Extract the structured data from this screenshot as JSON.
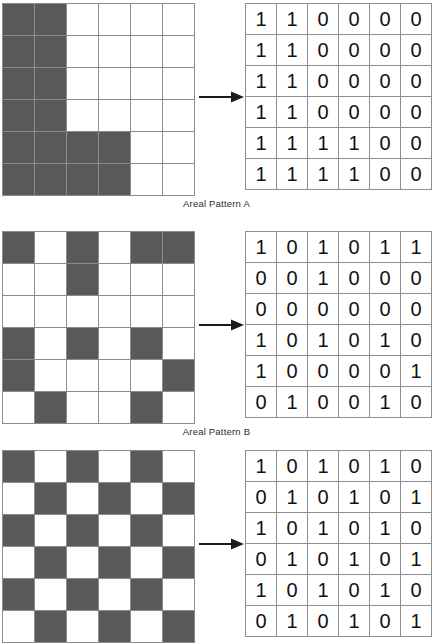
{
  "figure": {
    "colors": {
      "filled_cell": "#595959",
      "empty_cell": "#ffffff",
      "grid_line": "#8c8c8c",
      "table_border": "#8e8e8e",
      "arrow": "#1a1a1a",
      "text": "#2b2b2b"
    },
    "grid_size": {
      "rows": 6,
      "cols": 6
    }
  },
  "sections": [
    {
      "id": "a",
      "caption": "Areal Pattern A",
      "arrow_name": "conversion-arrow",
      "raster": [
        [
          1,
          1,
          0,
          0,
          0,
          0
        ],
        [
          1,
          1,
          0,
          0,
          0,
          0
        ],
        [
          1,
          1,
          0,
          0,
          0,
          0
        ],
        [
          1,
          1,
          0,
          0,
          0,
          0
        ],
        [
          1,
          1,
          1,
          1,
          0,
          0
        ],
        [
          1,
          1,
          1,
          1,
          0,
          0
        ]
      ],
      "matrix": [
        [
          "1",
          "1",
          "0",
          "0",
          "0",
          "0"
        ],
        [
          "1",
          "1",
          "0",
          "0",
          "0",
          "0"
        ],
        [
          "1",
          "1",
          "0",
          "0",
          "0",
          "0"
        ],
        [
          "1",
          "1",
          "0",
          "0",
          "0",
          "0"
        ],
        [
          "1",
          "1",
          "1",
          "1",
          "0",
          "0"
        ],
        [
          "1",
          "1",
          "1",
          "1",
          "0",
          "0"
        ]
      ]
    },
    {
      "id": "b",
      "caption": "Areal Pattern B",
      "arrow_name": "conversion-arrow",
      "raster": [
        [
          1,
          0,
          1,
          0,
          1,
          1
        ],
        [
          0,
          0,
          1,
          0,
          0,
          0
        ],
        [
          0,
          0,
          0,
          0,
          0,
          0
        ],
        [
          1,
          0,
          1,
          0,
          1,
          0
        ],
        [
          1,
          0,
          0,
          0,
          0,
          1
        ],
        [
          0,
          1,
          0,
          0,
          1,
          0
        ]
      ],
      "matrix": [
        [
          "1",
          "0",
          "1",
          "0",
          "1",
          "1"
        ],
        [
          "0",
          "0",
          "1",
          "0",
          "0",
          "0"
        ],
        [
          "0",
          "0",
          "0",
          "0",
          "0",
          "0"
        ],
        [
          "1",
          "0",
          "1",
          "0",
          "1",
          "0"
        ],
        [
          "1",
          "0",
          "0",
          "0",
          "0",
          "1"
        ],
        [
          "0",
          "1",
          "0",
          "0",
          "1",
          "0"
        ]
      ]
    },
    {
      "id": "c",
      "caption": "",
      "arrow_name": "conversion-arrow",
      "raster": [
        [
          1,
          0,
          1,
          0,
          1,
          0
        ],
        [
          0,
          1,
          0,
          1,
          0,
          1
        ],
        [
          1,
          0,
          1,
          0,
          1,
          0
        ],
        [
          0,
          1,
          0,
          1,
          0,
          1
        ],
        [
          1,
          0,
          1,
          0,
          1,
          0
        ],
        [
          0,
          1,
          0,
          1,
          0,
          1
        ]
      ],
      "matrix": [
        [
          "1",
          "0",
          "1",
          "0",
          "1",
          "0"
        ],
        [
          "0",
          "1",
          "0",
          "1",
          "0",
          "1"
        ],
        [
          "1",
          "0",
          "1",
          "0",
          "1",
          "0"
        ],
        [
          "0",
          "1",
          "0",
          "1",
          "0",
          "1"
        ],
        [
          "1",
          "0",
          "1",
          "0",
          "1",
          "0"
        ],
        [
          "0",
          "1",
          "0",
          "1",
          "0",
          "1"
        ]
      ]
    }
  ]
}
